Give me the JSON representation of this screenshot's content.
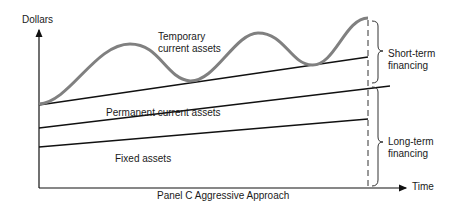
{
  "diagram": {
    "title": "Panel C  Aggressive Approach",
    "y_axis_label": "Dollars",
    "x_axis_label": "Time",
    "regions": {
      "temporary": "Temporary",
      "temporary_2": "current assets",
      "permanent": "Permanent current assets",
      "fixed": "Fixed assets"
    },
    "braces": {
      "short_term_1": "Short-term",
      "short_term_2": "financing",
      "long_term_1": "Long-term",
      "long_term_2": "financing"
    },
    "colors": {
      "curve": "#808080",
      "lines": "#111111",
      "text": "#1a1a1a"
    }
  }
}
